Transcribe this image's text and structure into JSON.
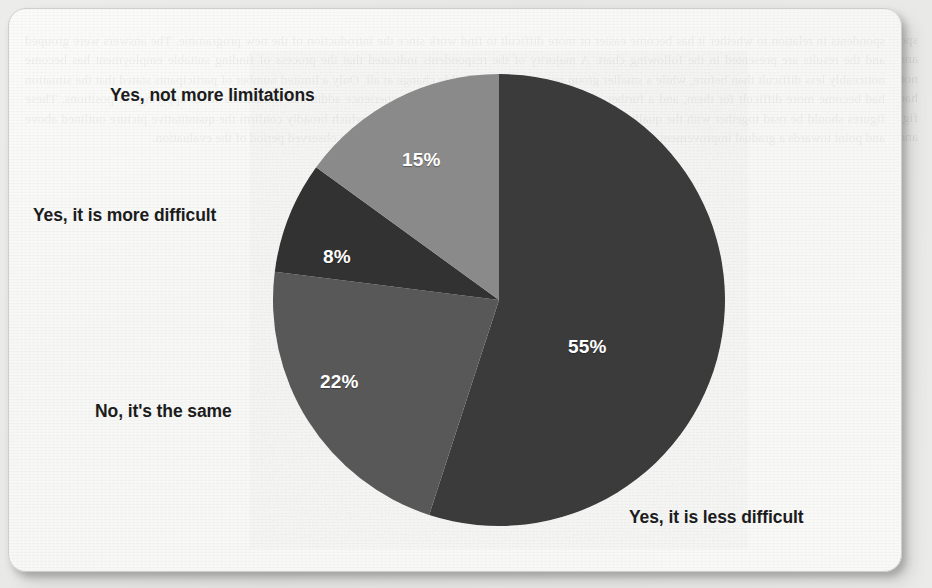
{
  "chart_data": {
    "type": "pie",
    "title": "",
    "labels": [
      "Yes, it is less difficult",
      "No, it's the same",
      "Yes, it is more difficult",
      "Yes, not more limitations"
    ],
    "values": [
      55,
      22,
      8,
      15
    ],
    "value_labels": [
      "55%",
      "22%",
      "8%",
      "15%"
    ],
    "units": "percent",
    "start_angle_deg": 0,
    "direction": "clockwise",
    "legend": "none",
    "grid": false,
    "slice_colors": [
      "#3a3a3a",
      "#585858",
      "#303030",
      "#8a8a8a"
    ],
    "slices": [
      {
        "label": "Yes, it is less difficult",
        "value": 55,
        "value_label": "55%",
        "color": "#3a3a3a",
        "start_deg": 0.0,
        "end_deg": 198.0
      },
      {
        "label": "No, it's the same",
        "value": 22,
        "value_label": "22%",
        "color": "#585858",
        "start_deg": 198.0,
        "end_deg": 277.2
      },
      {
        "label": "Yes, it is more difficult",
        "value": 8,
        "value_label": "8%",
        "color": "#303030",
        "start_deg": 277.2,
        "end_deg": 306.0
      },
      {
        "label": "Yes, not more limitations",
        "value": 15,
        "value_label": "15%",
        "color": "#8a8a8a",
        "start_deg": 306.0,
        "end_deg": 360.0
      }
    ]
  },
  "labels": {
    "slice_55_pct": "55%",
    "slice_22_pct": "22%",
    "slice_8_pct": "8%",
    "slice_15_pct": "15%",
    "cat_55": "Yes, it is less difficult",
    "cat_22": "No, it's the same",
    "cat_8": "Yes, it is more difficult",
    "cat_15": "Yes, not more limitations"
  },
  "page": {
    "background_color": "#e9e9e7",
    "card_color": "#f9f9f8",
    "label_color": "#1c1c1c",
    "value_label_color": "#ffffff",
    "showthrough_text": "spondents in relation to whether it has become easier or more difficult to find work since the introduction of the new programme. The answers were grouped and the results are presented in the following chart. A majority of the respondents indicated that the process of finding suitable employment has become noticeably less difficult than before, while a smaller group reported no perceptible change at all. Only a limited number of participants stated that the situation had become more difficult for them, and a further share answered that they no longer experience additional limitations when applying for positions. These figures should be read together with the qualitative comments collected during the interviews, which broadly confirm the quantitative picture outlined above and point towards a gradual improvement of access to the labour market for the target group over the observed period of the evaluation."
  }
}
